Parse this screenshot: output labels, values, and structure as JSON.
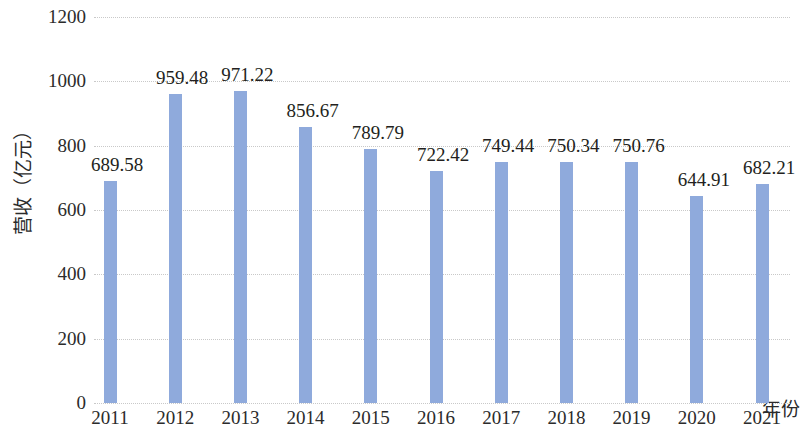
{
  "chart_data": {
    "type": "bar",
    "title": "",
    "xlabel": "年份",
    "ylabel": "营收（亿元）",
    "categories": [
      "2011",
      "2012",
      "2013",
      "2014",
      "2015",
      "2016",
      "2017",
      "2018",
      "2019",
      "2020",
      "2021"
    ],
    "values": [
      689.58,
      959.48,
      971.22,
      856.67,
      789.79,
      722.42,
      749.44,
      750.34,
      750.76,
      644.91,
      682.21
    ],
    "value_labels": [
      "689.58",
      "959.48",
      "971.22",
      "856.67",
      "789.79",
      "722.42",
      "749.44",
      "750.34",
      "750.76",
      "644.91",
      "682.21"
    ],
    "ylim": [
      0,
      1200
    ],
    "ytick_values": [
      0,
      200,
      400,
      600,
      800,
      1000,
      1200
    ],
    "ytick_labels": [
      "0",
      "200",
      "400",
      "600",
      "800",
      "1000",
      "1200"
    ],
    "grid": true,
    "grid_axis": "y",
    "legend": false,
    "bar_color": "#8faadc",
    "gridline_color": "#c9c9c9",
    "text_color": "#231f20",
    "background": "#ffffff"
  }
}
